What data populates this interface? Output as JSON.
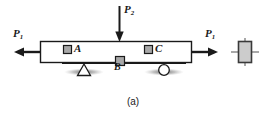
{
  "figure": {
    "caption": "(a)",
    "type": "engineering-mechanics-beam-diagram",
    "background_color": "#ffffff",
    "line_color": "#1a1a1a",
    "fill_color": "#ffffff",
    "marker_fill_color": "#a8a8a8",
    "element_fill_color": "#cccccc"
  },
  "loads": {
    "p1_left": {
      "label": "P",
      "subscript": "1",
      "direction": "left",
      "type": "axial-tension"
    },
    "p1_right": {
      "label": "P",
      "subscript": "1",
      "direction": "right",
      "type": "axial-tension"
    },
    "p2": {
      "label": "P",
      "subscript": "2",
      "direction": "down",
      "type": "transverse-point-load"
    }
  },
  "points": {
    "a": {
      "label": "A",
      "marker": "square"
    },
    "b": {
      "label": "B",
      "marker": "square"
    },
    "c": {
      "label": "C",
      "marker": "square"
    }
  },
  "supports": {
    "pin": {
      "name": "pin-support",
      "shape": "triangle"
    },
    "roller": {
      "name": "roller-support",
      "shape": "circle"
    }
  },
  "stress_element": {
    "name": "stress-element",
    "shape": "rectangle-with-crosshair"
  }
}
